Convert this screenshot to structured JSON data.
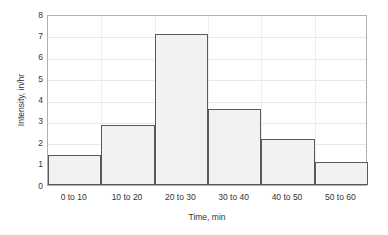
{
  "chart_data": {
    "type": "bar",
    "title": "",
    "subtitle": "",
    "xlabel": "Time, min",
    "ylabel": "Intensity, in/hr",
    "categories": [
      "0 to 10",
      "10 to 20",
      "20 to 30",
      "30 to 40",
      "40 to 50",
      "50 to 60"
    ],
    "values": [
      1.4,
      2.8,
      7.05,
      3.55,
      2.15,
      1.08
    ],
    "ylim": [
      0,
      8
    ],
    "yticks": [
      0,
      1,
      2,
      3,
      4,
      5,
      6,
      7,
      8
    ],
    "ytick_labels": [
      "0",
      "1",
      "2",
      "3",
      "4",
      "5",
      "6",
      "7",
      "8"
    ],
    "grid": true,
    "legend": false,
    "legend_position": "none",
    "bar_gap": 0,
    "style": {
      "bar_fill": "#f2f2f2",
      "bar_border": "#595959",
      "gridline": "#e8e8e8",
      "plot_border": "#b0b0b0",
      "text": "#333333",
      "background": "#ffffff"
    }
  }
}
